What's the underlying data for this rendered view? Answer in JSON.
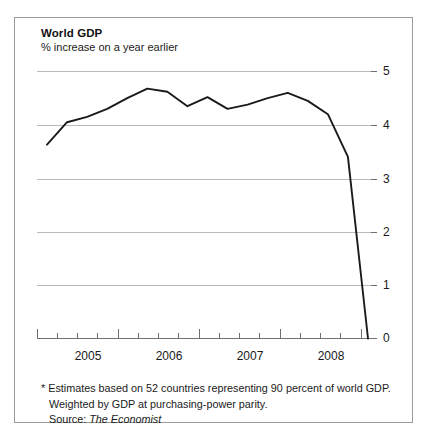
{
  "chart_data": {
    "type": "line",
    "title": "World GDP",
    "subtitle": "% increase on a year earlier",
    "xlabel": "",
    "ylabel": "",
    "ylim": [
      0,
      5
    ],
    "yticks": [
      0,
      1,
      2,
      3,
      4,
      5
    ],
    "ytick_labels": [
      "0",
      "1",
      "2",
      "3",
      "4",
      "5"
    ],
    "grid": true,
    "legend": "none",
    "xtick_labels": [
      "2005",
      "2006",
      "2007",
      "2008"
    ],
    "x_minor_ticks_per_year": 4,
    "x": [
      "2004 Q4",
      "2005 Q1",
      "2005 Q2",
      "2005 Q3",
      "2005 Q4",
      "2006 Q1",
      "2006 Q2",
      "2006 Q3",
      "2006 Q4",
      "2007 Q1",
      "2007 Q2",
      "2007 Q3",
      "2007 Q4",
      "2008 Q1",
      "2008 Q2",
      "2008 Q3",
      "2008 Q4"
    ],
    "values": [
      3.63,
      4.05,
      4.15,
      4.3,
      4.5,
      4.68,
      4.62,
      4.35,
      4.52,
      4.3,
      4.38,
      4.5,
      4.6,
      4.45,
      4.2,
      3.4,
      0.0
    ],
    "series": [
      {
        "name": "World GDP",
        "color": "#1a1a1a",
        "values": [
          3.63,
          4.05,
          4.15,
          4.3,
          4.5,
          4.68,
          4.62,
          4.35,
          4.52,
          4.3,
          4.38,
          4.5,
          4.6,
          4.45,
          4.2,
          3.4,
          0.0
        ]
      }
    ],
    "grid_color": "#b9b9b9",
    "axis_color": "#6f6f6f",
    "line_color": "#1a1a1a"
  },
  "footnotes": {
    "line1": "* Estimates based on 52 countries representing 90 percent of world GDP.",
    "line2": "Weighted by GDP at purchasing-power parity.",
    "source_label": "Source:",
    "source_name": "The Economist"
  }
}
